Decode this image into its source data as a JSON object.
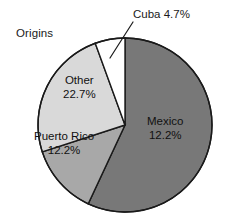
{
  "figure": {
    "title": "Origins",
    "background": "#ffffff"
  },
  "chart_data": {
    "type": "pie",
    "title": "Origins",
    "xlabel": "",
    "ylabel": "",
    "grid": false,
    "legend_position": "none",
    "labels_placement": "inside-slices-with-callout-for-cuba",
    "categories": [
      "Mexico",
      "Puerto Rico",
      "Other",
      "Cuba"
    ],
    "values": [
      12.2,
      12.2,
      22.7,
      4.7
    ],
    "value_unit": "%",
    "drawn_sweep_degrees": [
      205,
      47,
      88,
      20
    ],
    "start_angle_degrees": 0,
    "direction": "clockwise",
    "slices": [
      {
        "name": "Mexico",
        "label": "Mexico",
        "percent_text": "12.2%",
        "value": 12.2,
        "color": "#787878",
        "drawn_sweep_degrees": 205,
        "label_style": "inside"
      },
      {
        "name": "Puerto Rico",
        "label": "Puerto Rico",
        "percent_text": "12.2%",
        "value": 12.2,
        "color": "#a8a8a8",
        "drawn_sweep_degrees": 47,
        "label_style": "inside"
      },
      {
        "name": "Other",
        "label": "Other",
        "percent_text": "22.7%",
        "value": 22.7,
        "color": "#d9d9d9",
        "drawn_sweep_degrees": 88,
        "label_style": "inside"
      },
      {
        "name": "Cuba",
        "label": "Cuba 4.7%",
        "percent_text": "4.7%",
        "value": 4.7,
        "color": "#ffffff",
        "drawn_sweep_degrees": 20,
        "label_style": "callout-leader-line"
      }
    ]
  },
  "labels": {
    "mexico": {
      "name": "Mexico",
      "percent": "12.2%"
    },
    "puerto_rico": {
      "name": "Puerto Rico",
      "percent": "12.2%"
    },
    "other": {
      "name": "Other",
      "percent": "22.7%"
    },
    "cuba_callout": "Cuba 4.7%"
  },
  "colors": {
    "mexico": "#787878",
    "puerto_rico": "#a8a8a8",
    "other": "#d9d9d9",
    "cuba": "#ffffff",
    "outline": "#1a1a1a",
    "text": "#111111"
  }
}
